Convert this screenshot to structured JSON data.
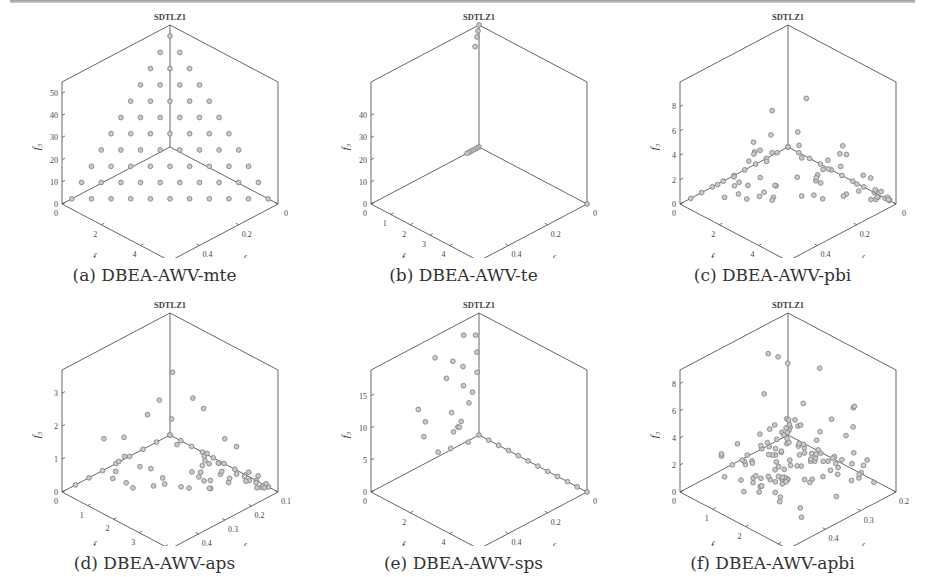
{
  "figure": {
    "panels": [
      {
        "id": "a",
        "title": "SDTLZ1",
        "caption": "(a) DBEA-AWV-mte"
      },
      {
        "id": "b",
        "title": "SDTLZ1",
        "caption": "(b) DBEA-AWV-te"
      },
      {
        "id": "c",
        "title": "SDTLZ1",
        "caption": "(c) DBEA-AWV-pbi"
      },
      {
        "id": "d",
        "title": "SDTLZ1",
        "caption": "(d) DBEA-AWV-aps"
      },
      {
        "id": "e",
        "title": "SDTLZ1",
        "caption": "(e) DBEA-AWV-sps"
      },
      {
        "id": "f",
        "title": "SDTLZ1",
        "caption": "(f) DBEA-AWV-apbi"
      }
    ]
  },
  "chart_data": [
    {
      "type": "scatter",
      "subtype": "scatter3d",
      "title": "SDTLZ1",
      "caption": "(a) DBEA-AWV-mte",
      "xlabel": "f1",
      "ylabel": "f2",
      "zlabel": "f3",
      "f1_ticks": [
        "0",
        "0.2",
        "0.4"
      ],
      "f2_ticks": [
        "0",
        "2",
        "4"
      ],
      "f3_ticks": [
        "0",
        "10",
        "20",
        "30",
        "40",
        "50"
      ],
      "zmax": 55,
      "f1max": 0.55,
      "f2max": 5.5,
      "description": "Uniform triangular grid of points on the linear Pareto front (f1/0.5 + f2/5 + f3/50 = 1), 11 divisions",
      "pattern": "simplex",
      "divisions": 10
    },
    {
      "type": "scatter",
      "subtype": "scatter3d",
      "title": "SDTLZ1",
      "caption": "(b) DBEA-AWV-te",
      "xlabel": "f1",
      "ylabel": "f2",
      "zlabel": "f3",
      "f1_ticks": [
        "0",
        "0.2",
        "0.4"
      ],
      "f2_ticks": [
        "0",
        "1",
        "2",
        "3",
        "4"
      ],
      "f3_ticks": [
        "0",
        "10",
        "20",
        "30",
        "40"
      ],
      "zmax": 55,
      "f1max": 0.55,
      "f2max": 5.5,
      "description": "Points clustered at the extremes: near f3 max apex and along f2 near 0-0.5, one at f1 corner",
      "points": [
        [
          0,
          0,
          55
        ],
        [
          0.005,
          0.1,
          53
        ],
        [
          0.01,
          0.2,
          51
        ],
        [
          0.02,
          0.4,
          48
        ],
        [
          0,
          0,
          0
        ],
        [
          0,
          0.1,
          0
        ],
        [
          0,
          0.2,
          0
        ],
        [
          0,
          0.3,
          0
        ],
        [
          0,
          0.4,
          0
        ],
        [
          0,
          0.5,
          0
        ],
        [
          0,
          0.6,
          0
        ],
        [
          0.55,
          0,
          0
        ]
      ]
    },
    {
      "type": "scatter",
      "subtype": "scatter3d",
      "title": "SDTLZ1",
      "caption": "(c) DBEA-AWV-pbi",
      "xlabel": "f1",
      "ylabel": "f2",
      "zlabel": "f3",
      "f1_ticks": [
        "0",
        "0.2",
        "0.4"
      ],
      "f2_ticks": [
        "0",
        "2",
        "4"
      ],
      "f3_ticks": [
        "0",
        "2",
        "4",
        "6",
        "8"
      ],
      "zmax": 10,
      "f1max": 0.55,
      "f2max": 5.5,
      "description": "Points spread over lower region, f3 up to about 9",
      "pattern": "pbi"
    },
    {
      "type": "scatter",
      "subtype": "scatter3d",
      "title": "SDTLZ1",
      "caption": "(d) DBEA-AWV-aps",
      "xlabel": "f1",
      "ylabel": "f2",
      "zlabel": "f3",
      "f1_ticks": [
        "0.1",
        "0.2",
        "0.3",
        "0.4",
        "0.5"
      ],
      "f2_ticks": [
        "0",
        "1",
        "2",
        "3",
        "4"
      ],
      "f3_ticks": [
        "0",
        "1",
        "2",
        "3"
      ],
      "zmax": 3.7,
      "f1max": 0.5,
      "f2max": 4.2,
      "description": "Points spread over lower region, f3 up to about 3.5",
      "pattern": "aps"
    },
    {
      "type": "scatter",
      "subtype": "scatter3d",
      "title": "SDTLZ1",
      "caption": "(e) DBEA-AWV-sps",
      "xlabel": "f1",
      "ylabel": "f2",
      "zlabel": "f3",
      "f1_ticks": [
        "0",
        "0.2",
        "0.4"
      ],
      "f2_ticks": [
        "0",
        "2",
        "4"
      ],
      "f3_ticks": [
        "0",
        "5",
        "10",
        "15"
      ],
      "zmax": 19,
      "f1max": 0.55,
      "f2max": 5.5,
      "description": "Points near f2~0 plane rising to f3~18, plus a row along f1 axis at f3=0",
      "pattern": "sps"
    },
    {
      "type": "scatter",
      "subtype": "scatter3d",
      "title": "SDTLZ1",
      "caption": "(f) DBEA-AWV-apbi",
      "xlabel": "f1",
      "ylabel": "f2",
      "zlabel": "f3",
      "f1_ticks": [
        "0.2",
        "0.3",
        "0.4",
        "0.5"
      ],
      "f2_ticks": [
        "0",
        "1",
        "2",
        "3"
      ],
      "f3_ticks": [
        "0",
        "2",
        "4",
        "6",
        "8"
      ],
      "zmax": 9,
      "f1max": 0.5,
      "f2max": 3.3,
      "description": "Dense cluster of points near origin with f3<2, few scattered up to f3~9",
      "pattern": "apbi"
    }
  ]
}
